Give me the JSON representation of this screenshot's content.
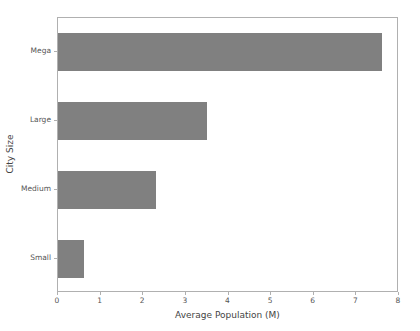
{
  "chart_data": {
    "type": "bar",
    "orientation": "horizontal",
    "title": "",
    "xlabel": "Average Population (M)",
    "ylabel": "City Size",
    "categories": [
      "Small",
      "Medium",
      "Large",
      "Mega"
    ],
    "values": [
      0.6,
      2.3,
      3.5,
      7.6
    ],
    "xlim": [
      0,
      8
    ],
    "xticks": [
      0,
      1,
      2,
      3,
      4,
      5,
      6,
      7,
      8
    ],
    "xtick_labels": [
      "0",
      "1",
      "2",
      "3",
      "4",
      "5",
      "6",
      "7",
      "8"
    ],
    "ytick_labels": [
      "Mega",
      "Large",
      "Medium",
      "Small"
    ],
    "grid": false,
    "legend": null,
    "bar_color": "#808080",
    "background_color": "#ffffff",
    "axis_color": "#b0b0b0",
    "tick_label_color": "#555555",
    "axis_label_color": "#444444"
  }
}
